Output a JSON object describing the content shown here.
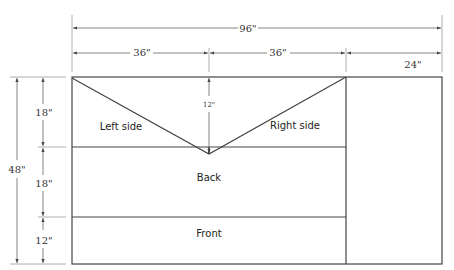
{
  "dimensions": {
    "total_width": "96\"",
    "left_width": "36\"",
    "middle_width": "36\"",
    "right_width": "24\"",
    "total_height": "48\"",
    "row1_height": "18\"",
    "row2_height": "18\"",
    "row3_height": "12\"",
    "v_depth": "12\""
  },
  "panels": {
    "left_side": "Left side",
    "right_side": "Right side",
    "back": "Back",
    "front": "Front"
  },
  "colors": {
    "line": "#444444",
    "text": "#333333"
  }
}
